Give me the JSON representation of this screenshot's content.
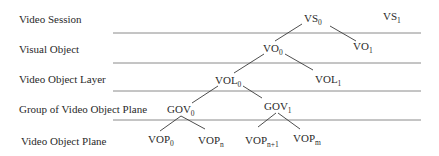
{
  "levels": [
    {
      "label": "Video Session"
    },
    {
      "label": "Visual Object"
    },
    {
      "label": "Video Object Layer"
    },
    {
      "label": "Group of Video Object Plane"
    },
    {
      "label": "Video Object Plane"
    }
  ],
  "nodes": [
    {
      "id": "vs0",
      "base": "VS",
      "sub": "0"
    },
    {
      "id": "vs1",
      "base": "VS",
      "sub": "1"
    },
    {
      "id": "vo0",
      "base": "VO",
      "sub": "0"
    },
    {
      "id": "vo1",
      "base": "VO",
      "sub": "1"
    },
    {
      "id": "vol0",
      "base": "VOL",
      "sub": "0"
    },
    {
      "id": "vol1",
      "base": "VOL",
      "sub": "1"
    },
    {
      "id": "gov0",
      "base": "GOV",
      "sub": "0"
    },
    {
      "id": "gov1",
      "base": "GOV",
      "sub": "1"
    },
    {
      "id": "vop0",
      "base": "VOP",
      "sub": "0"
    },
    {
      "id": "vopn",
      "base": "VOP",
      "sub": "n"
    },
    {
      "id": "vopn1",
      "base": "VOP",
      "sub": "n+1"
    },
    {
      "id": "vopm",
      "base": "VOP",
      "sub": "m"
    }
  ],
  "edges": [
    [
      "vs0",
      "vo0"
    ],
    [
      "vs0",
      "vo1"
    ],
    [
      "vo0",
      "vol0"
    ],
    [
      "vo0",
      "vol1"
    ],
    [
      "vol0",
      "gov0"
    ],
    [
      "vol0",
      "gov1"
    ],
    [
      "gov0",
      "vop0"
    ],
    [
      "gov0",
      "vopn"
    ],
    [
      "gov1",
      "vopn1"
    ],
    [
      "gov1",
      "vopm"
    ]
  ]
}
